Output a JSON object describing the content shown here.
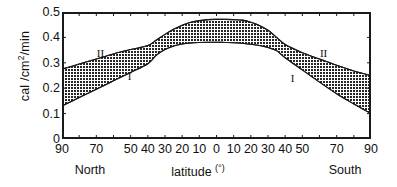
{
  "chart_data": {
    "type": "area",
    "title": "",
    "xlabel": "latitude (°)",
    "ylabel": "cal /cm2/min",
    "ylabel_prefix": "cal /cm",
    "ylabel_sup": "2",
    "ylabel_suffix": "/min",
    "xlabel_text": "latitude",
    "xlabel_sup": "(°)",
    "grid": false,
    "legend_position": "inline-annotations",
    "ylim": [
      0,
      0.5
    ],
    "yticks": [
      0,
      0.1,
      0.2,
      0.3,
      0.4,
      0.5
    ],
    "ytick_labels": [
      "0",
      "0.1",
      "0.2",
      "0.3",
      "0.4",
      "0.5"
    ],
    "xlim": [
      -90,
      90
    ],
    "xtick_values": [
      -90,
      -80,
      -70,
      -60,
      -50,
      -40,
      -30,
      -20,
      -10,
      0,
      10,
      20,
      30,
      40,
      50,
      60,
      70,
      80,
      90
    ],
    "xtick_labeled": [
      {
        "value": -90,
        "label": "90"
      },
      {
        "value": -70,
        "label": "70"
      },
      {
        "value": -50,
        "label": "50"
      },
      {
        "value": -40,
        "label": "40"
      },
      {
        "value": -30,
        "label": "30"
      },
      {
        "value": -20,
        "label": "20"
      },
      {
        "value": -10,
        "label": "10"
      },
      {
        "value": 0,
        "label": "0"
      },
      {
        "value": 10,
        "label": "10"
      },
      {
        "value": 20,
        "label": "20"
      },
      {
        "value": 30,
        "label": "30"
      },
      {
        "value": 40,
        "label": "40"
      },
      {
        "value": 50,
        "label": "50"
      },
      {
        "value": 70,
        "label": "70"
      },
      {
        "value": 90,
        "label": "90"
      }
    ],
    "hemisphere_left_label": "North",
    "hemisphere_right_label": "South",
    "annotations": [
      {
        "text": "II",
        "latitude": -68,
        "value": 0.335,
        "desc": "upper-curve-label-left"
      },
      {
        "text": "I",
        "latitude": -50,
        "value": 0.245,
        "desc": "lower-curve-label-left"
      },
      {
        "text": "II",
        "latitude": 62,
        "value": 0.335,
        "desc": "upper-curve-label-right"
      },
      {
        "text": "I",
        "latitude": 45,
        "value": 0.235,
        "desc": "lower-curve-label-right"
      }
    ],
    "series": [
      {
        "name": "II",
        "description": "upper boundary curve of shaded band",
        "x": [
          -90,
          -80,
          -70,
          -60,
          -50,
          -40,
          -35,
          -30,
          -25,
          -20,
          -15,
          -10,
          -5,
          0,
          5,
          10,
          15,
          20,
          25,
          30,
          35,
          40,
          50,
          60,
          70,
          80,
          90
        ],
        "values": [
          0.275,
          0.295,
          0.315,
          0.335,
          0.352,
          0.368,
          0.39,
          0.412,
          0.432,
          0.448,
          0.46,
          0.466,
          0.47,
          0.471,
          0.471,
          0.47,
          0.468,
          0.46,
          0.447,
          0.428,
          0.4,
          0.372,
          0.34,
          0.315,
          0.29,
          0.268,
          0.25
        ]
      },
      {
        "name": "I",
        "description": "lower boundary curve of shaded band",
        "x": [
          -90,
          -80,
          -70,
          -60,
          -50,
          -40,
          -35,
          -30,
          -25,
          -20,
          -15,
          -10,
          -5,
          0,
          5,
          10,
          15,
          20,
          25,
          30,
          35,
          40,
          50,
          60,
          70,
          80,
          90
        ],
        "values": [
          0.13,
          0.163,
          0.196,
          0.229,
          0.262,
          0.296,
          0.33,
          0.352,
          0.366,
          0.374,
          0.378,
          0.38,
          0.381,
          0.381,
          0.38,
          0.379,
          0.377,
          0.373,
          0.368,
          0.36,
          0.348,
          0.32,
          0.272,
          0.224,
          0.178,
          0.138,
          0.1
        ]
      }
    ],
    "crossing_points": [
      {
        "latitude": -38,
        "value": 0.36
      },
      {
        "latitude": 35,
        "value": 0.348
      }
    ],
    "colors": {
      "band_fill": "#2b2b2b",
      "axis": "#1a1a1a",
      "text": "#111111",
      "background": "#ffffff"
    }
  }
}
